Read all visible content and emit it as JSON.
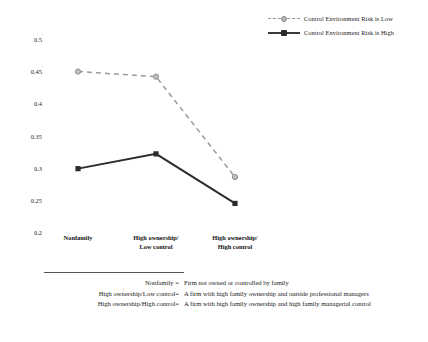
{
  "chart_data": {
    "type": "line",
    "title": "",
    "xlabel": "",
    "ylabel": "",
    "categories": [
      "Nonfamily",
      "High ownership/\nLow control",
      "High ownership/\nHigh control"
    ],
    "yticks": [
      "0.5",
      "0.45",
      "0.4",
      "0.35",
      "0.3",
      "0.25",
      "0.2"
    ],
    "ytick_values": [
      0.5,
      0.45,
      0.4,
      0.35,
      0.3,
      0.25,
      0.2
    ],
    "ylim": [
      0.2,
      0.5
    ],
    "grid": false,
    "legend_position": "top-right",
    "series": [
      {
        "name": "Control Environment Risk is Low",
        "values": [
          0.451,
          0.443,
          0.287
        ],
        "style": "dashed",
        "color": "#9a9a9a",
        "marker": "circle"
      },
      {
        "name": "Control Environment Risk is High",
        "values": [
          0.3,
          0.323,
          0.246
        ],
        "style": "solid",
        "color": "#2b2b2b",
        "marker": "square"
      }
    ]
  },
  "legend": {
    "items": [
      {
        "label": "Control Environment Risk is Low"
      },
      {
        "label": "Control Environment Risk is High"
      }
    ]
  },
  "footnote": {
    "rows": [
      {
        "term": "Nonfamily =",
        "definition": "Firm not owned or controlled by family"
      },
      {
        "term": "High ownership/Low control=",
        "definition": "A firm with high family ownership and outside professional managers"
      },
      {
        "term": "High ownership/High control=",
        "definition": "A firm with high family ownership and high family managerial control"
      }
    ]
  }
}
